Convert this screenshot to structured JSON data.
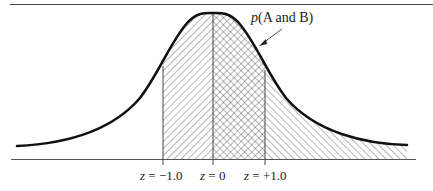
{
  "figure": {
    "type": "normal-distribution-diagram",
    "annotation": {
      "label_var": "p",
      "label_rest": "(A and B)",
      "full_text": "p(A and B)"
    },
    "z_markers": [
      {
        "label_var": "z",
        "label_rest": " = −1.0",
        "z": -1.0
      },
      {
        "label_var": "z",
        "label_rest": " = 0",
        "z": 0
      },
      {
        "label_var": "z",
        "label_rest": " = +1.0",
        "z": 1.0
      }
    ],
    "regions": [
      {
        "name": "A",
        "range": "z < 0 (from -1.0 to 0)",
        "pattern": "back-diagonal hatch"
      },
      {
        "name": "A and B",
        "range": "0 to +1.0",
        "pattern": "cross-hatch"
      },
      {
        "name": "B",
        "range": "z > 0 (from +1.0 to right tail)",
        "pattern": "forward-diagonal hatch"
      }
    ],
    "colors": {
      "curve": "#111111",
      "hatch": "#333333",
      "axis": "#555555",
      "background": "#ffffff"
    }
  }
}
